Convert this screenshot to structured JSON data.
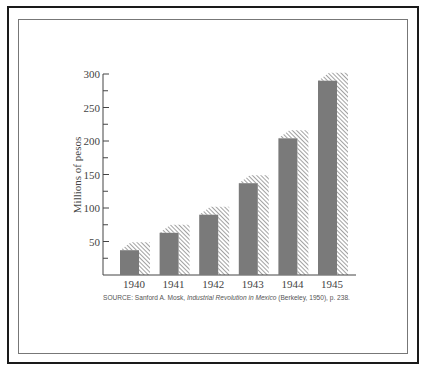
{
  "chart_data": {
    "type": "bar",
    "title": "",
    "xlabel": "",
    "ylabel": "Millions of pesos",
    "categories": [
      "1940",
      "1941",
      "1942",
      "1943",
      "1944",
      "1945"
    ],
    "values": [
      37,
      63,
      90,
      137,
      204,
      290
    ],
    "ylim": [
      0,
      300
    ],
    "yticks": [
      50,
      100,
      150,
      200,
      250,
      300
    ],
    "grid": false,
    "legend": null,
    "style": "3D bars, grey front face with hatched top and right side"
  },
  "source": {
    "prefix": "SOURCE: Sanford A. Mosk, ",
    "title": "Industrial Revolution in Mexico",
    "suffix": " (Berkeley, 1950), p. 238."
  },
  "colors": {
    "bar_front": "#7a7a7a",
    "hatch": "#444444",
    "axis": "#444444",
    "frame": "#1a1a1a"
  }
}
